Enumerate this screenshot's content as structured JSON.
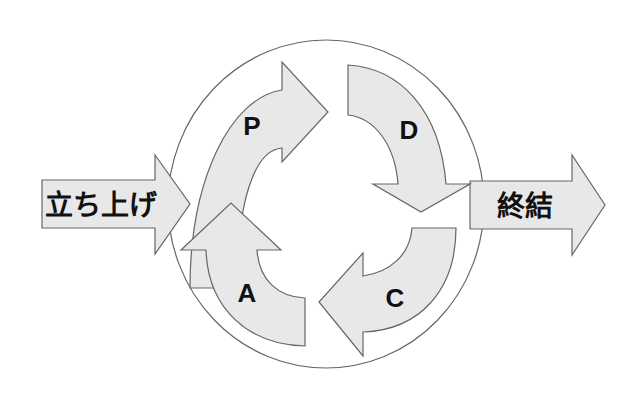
{
  "diagram": {
    "type": "pdca-cycle",
    "colors": {
      "fill": "#e8e8e8",
      "stroke": "#666666",
      "text": "#111111",
      "background": "#ffffff"
    },
    "start": {
      "label": "立ち上げ"
    },
    "end": {
      "label": "終結"
    },
    "cycle": [
      {
        "id": "plan",
        "label": "P"
      },
      {
        "id": "do",
        "label": "D"
      },
      {
        "id": "check",
        "label": "C"
      },
      {
        "id": "act",
        "label": "A"
      }
    ]
  }
}
